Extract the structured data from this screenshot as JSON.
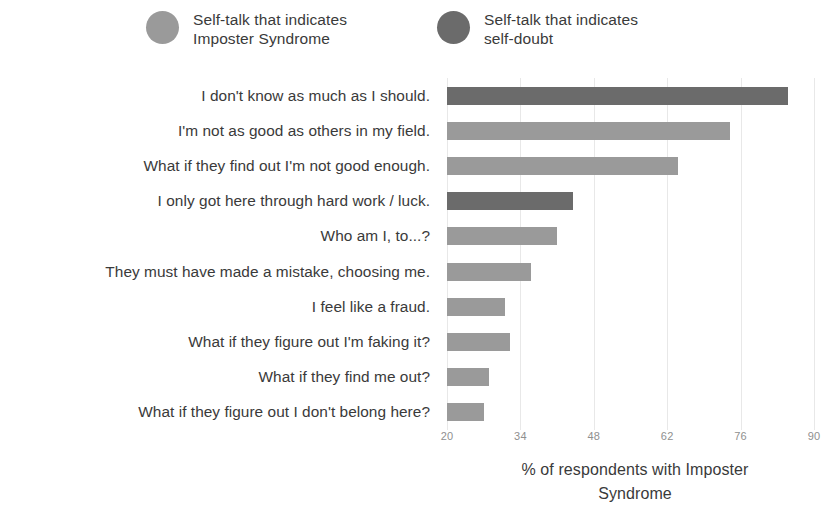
{
  "legend": {
    "items": [
      {
        "label": "Self-talk that indicates\nImposter Syndrome",
        "color": "#9a9a9a",
        "key": "imposter"
      },
      {
        "label": "Self-talk that indicates\nself-doubt",
        "color": "#6b6b6b",
        "key": "selfdoubt"
      }
    ]
  },
  "chart_data": {
    "type": "bar",
    "orientation": "horizontal",
    "title": "",
    "xlabel": "% of respondents with Imposter Syndrome",
    "ylabel": "",
    "xlim": [
      20,
      90
    ],
    "xticks": [
      20,
      34,
      48,
      62,
      76,
      90
    ],
    "xtick_labels": [
      "20",
      "34",
      "48",
      "62",
      "76",
      "90"
    ],
    "grid": true,
    "legend_position": "top",
    "categories": [
      "I don't know as much as I should.",
      "I'm not as good as others in my field.",
      "What if they find out I'm not good enough.",
      "I only got here through hard work / luck.",
      "Who am I, to...?",
      "They must have made a mistake, choosing me.",
      "I feel like a fraud.",
      "What if they figure out I'm faking it?",
      "What if they find me out?",
      "What if they figure out I don't belong here?"
    ],
    "values": [
      85,
      74,
      64,
      44,
      41,
      36,
      31,
      32,
      28,
      27
    ],
    "series_key": [
      "selfdoubt",
      "imposter",
      "imposter",
      "selfdoubt",
      "imposter",
      "imposter",
      "imposter",
      "imposter",
      "imposter",
      "imposter"
    ],
    "colors": {
      "imposter": "#9a9a9a",
      "selfdoubt": "#6b6b6b"
    }
  },
  "axis_title_text": "% of respondents with Imposter\nSyndrome"
}
